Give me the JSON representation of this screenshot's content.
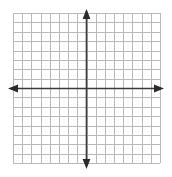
{
  "figure": {
    "name": "blank-cartesian-coordinate-grid",
    "title": "",
    "background_color": "#ffffff",
    "width": 172,
    "height": 177
  },
  "chart_data": {
    "type": "scatter",
    "title": "",
    "subtitle": "",
    "xlabel": "",
    "ylabel": "",
    "x": [],
    "y": [],
    "series": [],
    "xlim": [
      -8,
      8
    ],
    "ylim": [
      -8,
      8
    ],
    "xticks": [
      -8,
      -7,
      -6,
      -5,
      -4,
      -3,
      -2,
      -1,
      0,
      1,
      2,
      3,
      4,
      5,
      6,
      7,
      8
    ],
    "yticks": [
      -8,
      -7,
      -6,
      -5,
      -4,
      -3,
      -2,
      -1,
      0,
      1,
      2,
      3,
      4,
      5,
      6,
      7,
      8
    ],
    "xtick_labels": [],
    "ytick_labels": [],
    "grid": true,
    "grid_columns": 16,
    "grid_rows": 16,
    "legend": null,
    "legend_position": "none",
    "annotations": [],
    "axis_arrows": [
      "up",
      "down",
      "left",
      "right"
    ],
    "origin": [
      0,
      0
    ]
  },
  "style": {
    "grid_line_color": "#b9b9b9",
    "grid_line_width": 1,
    "axis_color": "#3a3a3a",
    "axis_line_width": 1.6,
    "arrow_color": "#2b2b2b",
    "plot_area": {
      "left": 13,
      "top": 13,
      "right": 160,
      "bottom": 163
    }
  }
}
